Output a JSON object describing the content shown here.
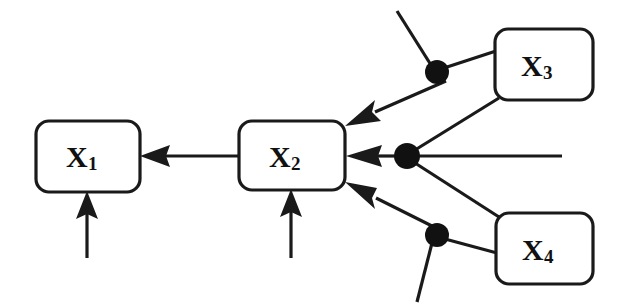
{
  "diagram": {
    "type": "node-link-diagram",
    "background_color": "#ffffff",
    "stroke_color": "#1a1a1a",
    "dot_color": "#111111",
    "nodes": [
      {
        "id": "X1",
        "base": "X",
        "sub": "1",
        "x": 36,
        "y": 121,
        "w": 104,
        "h": 71,
        "rx": 13
      },
      {
        "id": "X2",
        "base": "X",
        "sub": "2",
        "x": 239,
        "y": 121,
        "w": 106,
        "h": 69,
        "rx": 13
      },
      {
        "id": "X3",
        "base": "X",
        "sub": "3",
        "x": 495,
        "y": 29,
        "w": 98,
        "h": 71,
        "rx": 13
      },
      {
        "id": "X4",
        "base": "X",
        "sub": "4",
        "x": 496,
        "y": 213,
        "w": 97,
        "h": 71,
        "rx": 13
      }
    ],
    "junctions": [
      {
        "id": "dot-top",
        "cx": 437,
        "cy": 72,
        "r": 12
      },
      {
        "id": "dot-middle",
        "cx": 407,
        "cy": 156,
        "r": 13
      },
      {
        "id": "dot-bottom",
        "cx": 437,
        "cy": 235,
        "r": 12
      }
    ],
    "edges": [
      {
        "id": "x2-to-x1",
        "from": "X2",
        "to": "X1",
        "arrow": true
      },
      {
        "id": "noise-to-x1",
        "from": "free-bottom",
        "to": "X1",
        "arrow": true
      },
      {
        "id": "noise-to-x2",
        "from": "free-bottom",
        "to": "X2",
        "arrow": true
      },
      {
        "id": "top-to-x2",
        "from": "dot-top",
        "to": "X2",
        "arrow": true
      },
      {
        "id": "middle-to-x2",
        "from": "dot-middle",
        "to": "X2",
        "arrow": true
      },
      {
        "id": "bottom-to-x2",
        "from": "dot-bottom",
        "to": "X2",
        "arrow": true
      },
      {
        "id": "x3-to-top",
        "from": "X3",
        "to": "dot-top",
        "arrow": false
      },
      {
        "id": "x3-to-middle",
        "from": "X3",
        "to": "dot-middle",
        "arrow": false
      },
      {
        "id": "x4-to-middle",
        "from": "X4",
        "to": "dot-middle",
        "arrow": false
      },
      {
        "id": "x4-to-bottom",
        "from": "X4",
        "to": "dot-bottom",
        "arrow": false
      },
      {
        "id": "free-into-top",
        "from": "free-upper-left",
        "to": "dot-top",
        "arrow": false
      },
      {
        "id": "free-into-middle",
        "from": "free-right",
        "to": "dot-middle",
        "arrow": false
      },
      {
        "id": "free-into-bottom",
        "from": "free-lower-left",
        "to": "dot-bottom",
        "arrow": false
      }
    ]
  }
}
